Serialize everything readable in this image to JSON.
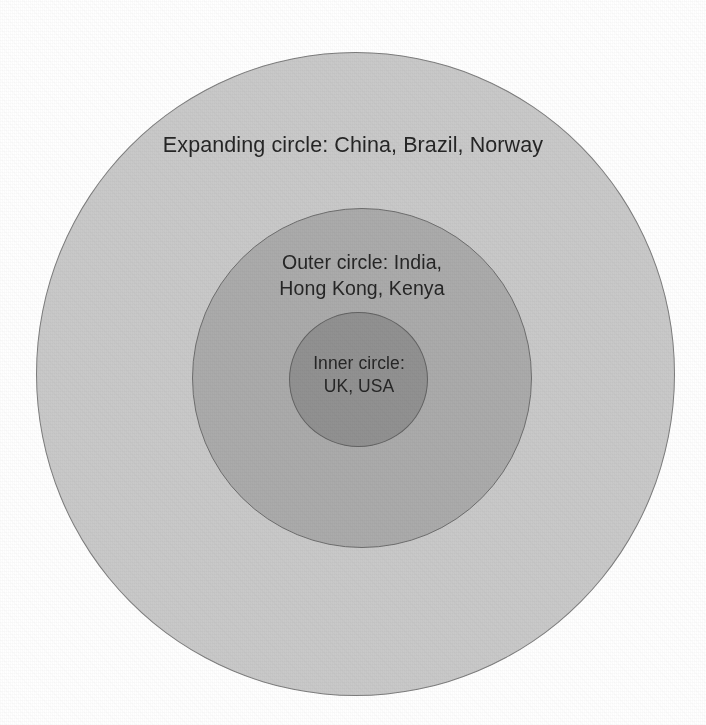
{
  "chart_data": {
    "type": "diagram",
    "subtype": "concentric-circles",
    "background_color": "#ffffff",
    "canvas": {
      "width": 706,
      "height": 725
    },
    "rings": [
      {
        "id": "expanding",
        "name": "Expanding circle",
        "label": "Expanding circle: China, Brazil, Norway",
        "members": [
          "China",
          "Brazil",
          "Norway"
        ],
        "fill_color": "#c9c9c9",
        "stroke_color": "#7d7d7d",
        "center": {
          "x": 355,
          "y": 374
        },
        "radius": 320,
        "level": 3
      },
      {
        "id": "outer",
        "name": "Outer circle",
        "label": "Outer circle: India,\nHong Kong, Kenya",
        "members": [
          "India",
          "Hong Kong",
          "Kenya"
        ],
        "fill_color": "#ababab",
        "stroke_color": "#6e6e6e",
        "center": {
          "x": 362,
          "y": 378
        },
        "radius": 170,
        "level": 2
      },
      {
        "id": "inner",
        "name": "Inner circle",
        "label": "Inner circle:\nUK, USA",
        "members": [
          "UK",
          "USA"
        ],
        "fill_color": "#919191",
        "stroke_color": "#636363",
        "center": {
          "x": 359,
          "y": 380
        },
        "radius": 69,
        "level": 1
      }
    ]
  },
  "labels": {
    "expanding": "Expanding circle: China, Brazil, Norway",
    "outer": "Outer circle: India,\nHong Kong, Kenya",
    "inner": "Inner circle:\nUK, USA"
  }
}
